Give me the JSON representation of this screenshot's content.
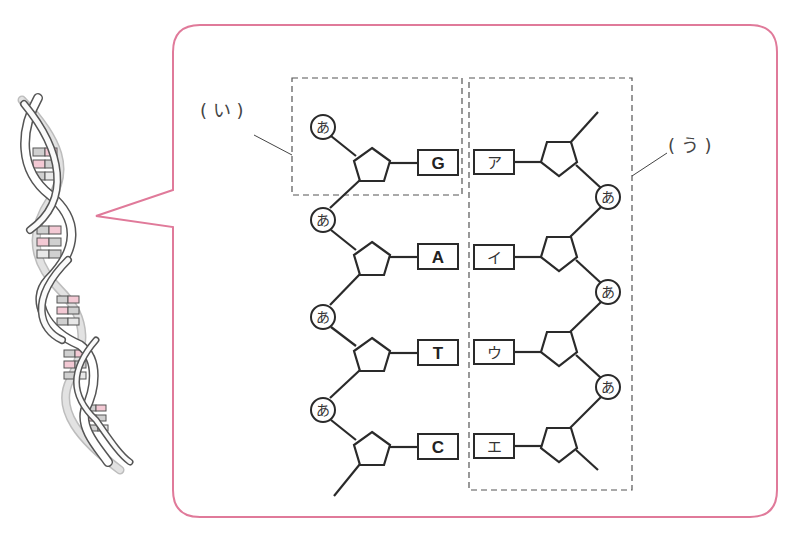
{
  "figure": {
    "type": "DNA double-helix structure diagram",
    "callout_border_color": "#e07a9a",
    "line_color": "#2a2a2a",
    "dashed_color": "#555555",
    "helix_pink": "#f3c9d4",
    "helix_gray": "#d8d8d8"
  },
  "labels": {
    "nucleotide_box": "( い )",
    "strand_box": "( う )"
  },
  "phosphate_label": "あ",
  "left_strand": {
    "bases": [
      "G",
      "A",
      "T",
      "C"
    ],
    "phosphates": [
      "あ",
      "あ",
      "あ",
      "あ"
    ]
  },
  "right_strand": {
    "bases": [
      "ア",
      "イ",
      "ウ",
      "エ"
    ],
    "phosphates": [
      "あ",
      "あ",
      "あ"
    ]
  }
}
